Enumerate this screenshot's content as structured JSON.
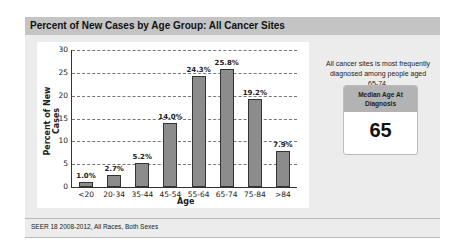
{
  "header": {
    "title": "Percent of New Cases by Age Group: All Cancer Sites"
  },
  "side": {
    "note": "All cancer sites is most frequently diagnosed among people aged 65-74.",
    "median_label": "Median Age At Diagnosis",
    "median_value": "65"
  },
  "footer": {
    "text": "SEER 18 2008-2012, All Races, Both Sexes"
  },
  "chart_data": {
    "type": "bar",
    "title": "Percent of New Cases by Age Group: All Cancer Sites",
    "xlabel": "Age",
    "ylabel": "Percent of New Cases",
    "categories": [
      "<20",
      "20-34",
      "35-44",
      "45-54",
      "55-64",
      "65-74",
      "75-84",
      ">84"
    ],
    "values": [
      1.0,
      2.7,
      5.2,
      14.0,
      24.3,
      25.8,
      19.2,
      7.9
    ],
    "value_labels": [
      "1.0%",
      "2.7%",
      "5.2%",
      "14.0%",
      "24.3%",
      "25.8%",
      "19.2%",
      "7.9%"
    ],
    "yticks": [
      "0",
      "5",
      "10",
      "15",
      "20",
      "25",
      "30"
    ],
    "ylim": [
      0,
      30
    ],
    "grid": true,
    "legend": null,
    "bar_color": "#8c8c8c"
  }
}
